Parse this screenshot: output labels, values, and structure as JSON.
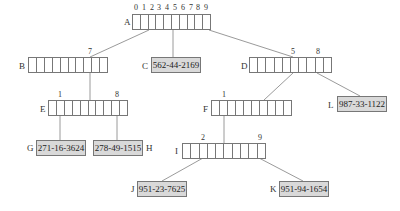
{
  "diagram": {
    "title": "",
    "colors": {
      "line": "#808080",
      "leaf_fill": "#d9d9d9",
      "border": "#777777"
    },
    "nodes": {
      "A": {
        "label": "A",
        "type": "array",
        "cells": 10,
        "index_labels": [
          "0",
          "1",
          "2",
          "3",
          "4",
          "5",
          "6",
          "7",
          "8",
          "9"
        ]
      },
      "B": {
        "label": "B",
        "type": "array",
        "cells": 10,
        "index_labels": [
          "7"
        ]
      },
      "C": {
        "label": "C",
        "type": "leaf",
        "value": "562-44-2169"
      },
      "D": {
        "label": "D",
        "type": "array",
        "cells": 10,
        "index_labels": [
          "5",
          "8"
        ]
      },
      "E": {
        "label": "E",
        "type": "array",
        "cells": 10,
        "index_labels": [
          "1",
          "8"
        ]
      },
      "F": {
        "label": "F",
        "type": "array",
        "cells": 10,
        "index_labels": [
          "1"
        ]
      },
      "G": {
        "label": "G",
        "type": "leaf",
        "value": "271-16-3624"
      },
      "H": {
        "label": "H",
        "type": "leaf",
        "value": "278-49-1515"
      },
      "I": {
        "label": "I",
        "type": "array",
        "cells": 10,
        "index_labels": [
          "2",
          "9"
        ]
      },
      "J": {
        "label": "J",
        "type": "leaf",
        "value": "951-23-7625"
      },
      "K": {
        "label": "K",
        "type": "leaf",
        "value": "951-94-1654"
      },
      "L": {
        "label": "L",
        "type": "leaf",
        "value": "987-33-1122"
      }
    },
    "edges": [
      {
        "from": "A",
        "slot": "2",
        "to": "B"
      },
      {
        "from": "A",
        "slot": "5",
        "to": "C"
      },
      {
        "from": "A",
        "slot": "9",
        "to": "D"
      },
      {
        "from": "B",
        "slot": "7",
        "to": "E"
      },
      {
        "from": "D",
        "slot": "5",
        "to": "F"
      },
      {
        "from": "D",
        "slot": "8",
        "to": "L"
      },
      {
        "from": "E",
        "slot": "1",
        "to": "G"
      },
      {
        "from": "E",
        "slot": "8",
        "to": "H"
      },
      {
        "from": "F",
        "slot": "1",
        "to": "I"
      },
      {
        "from": "I",
        "slot": "2",
        "to": "J"
      },
      {
        "from": "I",
        "slot": "9",
        "to": "K"
      }
    ]
  }
}
